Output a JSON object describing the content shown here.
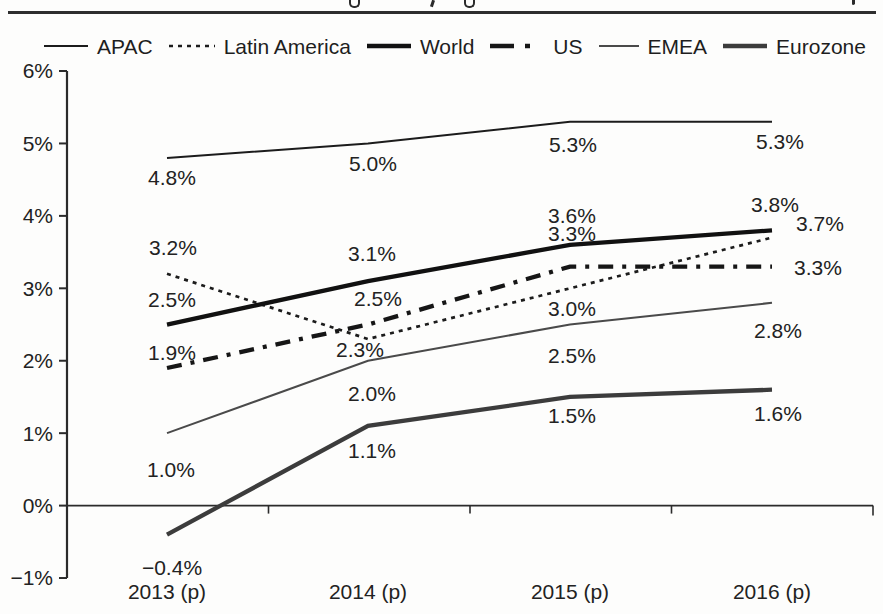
{
  "figure": {
    "top_divider": true,
    "cropped_title_visible": false
  },
  "chart_data": {
    "type": "line",
    "title": "",
    "categories": [
      "2013 (p)",
      "2014 (p)",
      "2015 (p)",
      "2016 (p)"
    ],
    "xlabel": "",
    "ylabel": "",
    "unit": "%",
    "ylim": [
      -1,
      6
    ],
    "grid": false,
    "legend_position": "top",
    "y_axis": {
      "tick_values": [
        6,
        5,
        4,
        3,
        2,
        1,
        0,
        -1
      ],
      "tick_labels": [
        "6%",
        "5%",
        "4%",
        "3%",
        "2%",
        "1%",
        "0%",
        "−1%"
      ]
    },
    "series": [
      {
        "name": "APAC",
        "values": [
          4.8,
          5.0,
          5.3,
          5.3
        ],
        "labels": [
          "4.8%",
          "5.0%",
          "5.3%",
          "5.3%"
        ],
        "color": "#1c1c1c",
        "line_style": "solid",
        "line_weight": "thin"
      },
      {
        "name": "Latin America",
        "values": [
          3.2,
          2.3,
          3.0,
          3.7
        ],
        "labels": [
          "3.2%",
          "2.3%",
          "3.0%",
          "3.7%"
        ],
        "color": "#1c1c1c",
        "line_style": "dotted",
        "line_weight": "medium"
      },
      {
        "name": "World",
        "values": [
          2.5,
          3.1,
          3.6,
          3.8
        ],
        "labels": [
          "2.5%",
          "3.1%",
          "3.6%",
          "3.8%"
        ],
        "color": "#111111",
        "line_style": "solid",
        "line_weight": "thick"
      },
      {
        "name": "US",
        "values": [
          1.9,
          2.5,
          3.3,
          3.3
        ],
        "labels": [
          "1.9%",
          "2.5%",
          "3.3%",
          "3.3%"
        ],
        "color": "#161616",
        "line_style": "dash-dot",
        "line_weight": "thick"
      },
      {
        "name": "EMEA",
        "values": [
          1.0,
          2.0,
          2.5,
          2.8
        ],
        "labels": [
          "1.0%",
          "2.0%",
          "2.5%",
          "2.8%"
        ],
        "color": "#4a4a4a",
        "line_style": "solid",
        "line_weight": "thin"
      },
      {
        "name": "Eurozone",
        "values": [
          -0.4,
          1.1,
          1.5,
          1.6
        ],
        "labels": [
          "−0.4%",
          "1.1%",
          "1.5%",
          "1.6%"
        ],
        "color": "#3c3c3c",
        "line_style": "solid",
        "line_weight": "thick"
      }
    ]
  }
}
